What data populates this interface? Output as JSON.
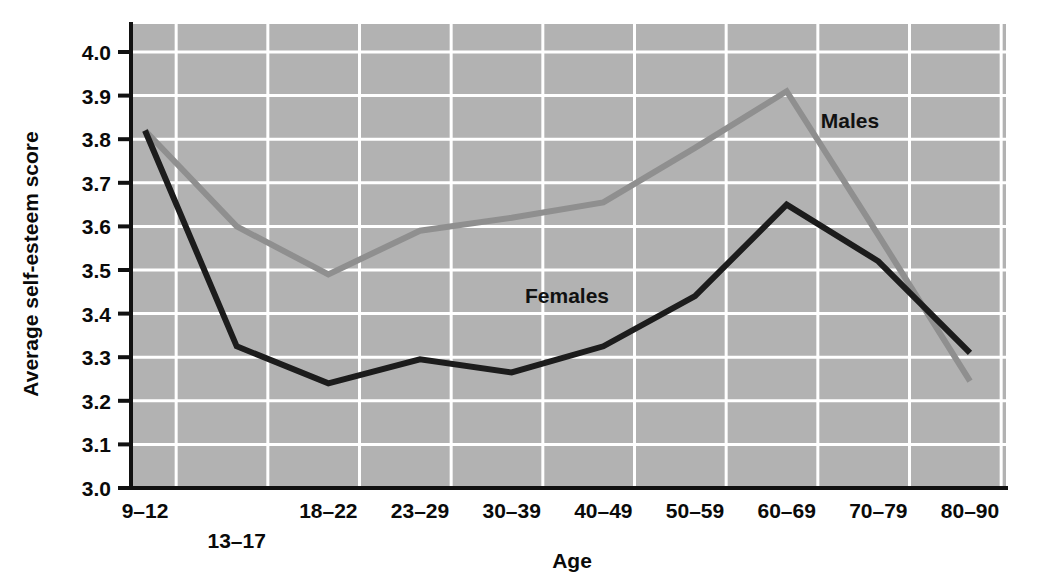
{
  "chart_data": {
    "type": "line",
    "title": "",
    "xlabel": "Age",
    "ylabel": "Average self-esteem score",
    "categories": [
      "9–12",
      "13–17",
      "18–22",
      "23–29",
      "30–39",
      "40–49",
      "50–59",
      "60–69",
      "70–79",
      "80–90"
    ],
    "ylim": [
      3.0,
      4.0
    ],
    "ytick_labels": [
      "3.0",
      "3.1",
      "3.2",
      "3.3",
      "3.4",
      "3.5",
      "3.6",
      "3.7",
      "3.8",
      "3.9",
      "4.0"
    ],
    "ytick_values": [
      3.0,
      3.1,
      3.2,
      3.3,
      3.4,
      3.5,
      3.6,
      3.7,
      3.8,
      3.9,
      4.0
    ],
    "grid": true,
    "legend_position": "inline-annotations",
    "series": [
      {
        "name": "Males",
        "color": "#8f8f8f",
        "values": [
          3.82,
          3.6,
          3.49,
          3.59,
          3.62,
          3.655,
          3.78,
          3.91,
          3.58,
          3.245
        ]
      },
      {
        "name": "Females",
        "color": "#1c1c1c",
        "values": [
          3.82,
          3.325,
          3.24,
          3.295,
          3.265,
          3.325,
          3.44,
          3.65,
          3.52,
          3.31
        ]
      }
    ],
    "annotations": [
      {
        "text": "Males",
        "series": "Males"
      },
      {
        "text": "Females",
        "series": "Females"
      }
    ]
  },
  "style": {
    "plot_background": "#b2b2b2",
    "grid_color": "#ffffff",
    "axis_color": "#111111",
    "page_background": "#ffffff"
  }
}
